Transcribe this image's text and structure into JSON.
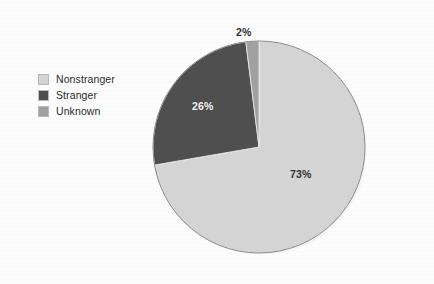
{
  "chart_data": {
    "type": "pie",
    "title": "",
    "subtitle": "",
    "xlabel": "",
    "ylabel": "",
    "categories": [
      "Nonstranger",
      "Stranger",
      "Unknown"
    ],
    "values": [
      73,
      26,
      2
    ],
    "value_labels": [
      "73%",
      "26%",
      "2%"
    ],
    "units": "percent",
    "start_angle_deg": 0,
    "direction": "clockwise",
    "slice_order_from_top_clockwise": [
      "Nonstranger",
      "Stranger",
      "Unknown"
    ],
    "legend": {
      "position": "left",
      "entries": [
        {
          "label": "Nonstranger",
          "color": "#d4d4d4",
          "value": 73,
          "value_label": "73%"
        },
        {
          "label": "Stranger",
          "color": "#4f4f4f",
          "value": 26,
          "value_label": "26%"
        },
        {
          "label": "Unknown",
          "color": "#a0a0a0",
          "value": 2,
          "value_label": "2%"
        }
      ]
    },
    "grid": false,
    "annotations": []
  },
  "figure": {
    "background_color": "#fdfdfd",
    "shadow_color": "#8f8f8f"
  },
  "pie": {
    "center_x": 107,
    "center_y": 107,
    "radius": 106,
    "slices": [
      {
        "name": "Nonstranger",
        "percent": 73,
        "label": "73%",
        "color": "#d4d4d4",
        "label_color": "#303030"
      },
      {
        "name": "Stranger",
        "percent": 26,
        "label": "26%",
        "color": "#4f4f4f",
        "label_color": "#f2f2f2"
      },
      {
        "name": "Unknown",
        "percent": 2,
        "label": "2%",
        "color": "#a0a0a0",
        "label_color": "#303030"
      }
    ]
  }
}
